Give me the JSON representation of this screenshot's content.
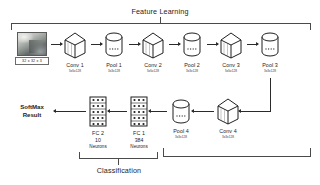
{
  "diagram": {
    "title_feature": "Feature Learning",
    "title_classification": "Classification",
    "softmax_line1": "SoftMax",
    "softmax_line2": "Result",
    "input": {
      "name": "input-image",
      "dims": "32 x 32 x 3"
    },
    "feature_layers": [
      {
        "name": "Conv 1",
        "dims": "5x5x128",
        "shape": "cube"
      },
      {
        "name": "Pool 1",
        "dims": "3x3x128",
        "shape": "cylinder"
      },
      {
        "name": "Conv 2",
        "dims": "5x5x128",
        "shape": "cube"
      },
      {
        "name": "Pool 2",
        "dims": "3x3x128",
        "shape": "cylinder"
      },
      {
        "name": "Conv 3",
        "dims": "5x5x128",
        "shape": "cube"
      },
      {
        "name": "Pool 3",
        "dims": "3x3x128",
        "shape": "cylinder"
      }
    ],
    "classification_layers": [
      {
        "name": "Conv 4",
        "dims": "3x3x128",
        "shape": "cube"
      },
      {
        "name": "Pool 4",
        "dims": "3x3x128",
        "shape": "cylinder"
      },
      {
        "name": "FC 1",
        "count": "384",
        "unit": "Neurons",
        "shape": "grid"
      },
      {
        "name": "FC 2",
        "count": "10",
        "unit": "Neurons",
        "shape": "grid"
      }
    ],
    "colors": {
      "ink": "#1d1d1d",
      "line": "#2b2b2b",
      "bracket": "#4a4a4a",
      "bg": "#ffffff"
    }
  }
}
